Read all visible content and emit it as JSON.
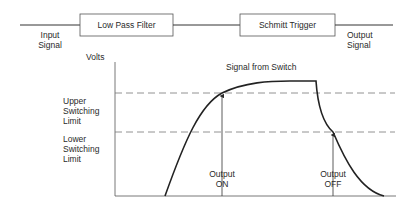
{
  "block_diagram": {
    "input_label_line1": "Input",
    "input_label_line2": "Signal",
    "blocks": [
      {
        "label": "Low Pass Filter"
      },
      {
        "label": "Schmitt Trigger"
      }
    ],
    "output_label_line1": "Output",
    "output_label_line2": "Signal"
  },
  "graph": {
    "y_axis_label": "Volts",
    "curve_label": "Signal from Switch",
    "upper_limit": {
      "line1": "Upper",
      "line2": "Switching",
      "line3": "Limit"
    },
    "lower_limit": {
      "line1": "Lower",
      "line2": "Switching",
      "line3": "Limit"
    },
    "markers": [
      {
        "line1": "Output",
        "line2": "ON"
      },
      {
        "line1": "Output",
        "line2": "OFF"
      }
    ]
  },
  "colors": {
    "line": "#2a2a2a",
    "dashed": "#777777",
    "box_border": "#555555"
  }
}
